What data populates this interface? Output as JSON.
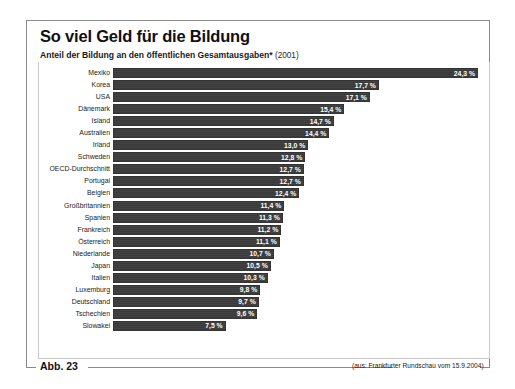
{
  "figure": {
    "title": "So viel Geld für die Bildung",
    "subtitle_main": "Anteil der Bildung an den öffentlichen Gesamtausgaben*",
    "subtitle_year": "(2001)",
    "figure_label": "Abb. 23",
    "source": "(aus: Frankfurter Rundschau vom 15.9.2004)"
  },
  "colors": {
    "bar_fill": "#3a3a3a",
    "frame": "#8a8a8a",
    "panel_border": "#c9c9c9",
    "text": "#111111",
    "value_text": "#ffffff"
  },
  "chart_data": {
    "type": "bar",
    "orientation": "horizontal",
    "title": "So viel Geld für die Bildung",
    "subtitle": "Anteil der Bildung an den öffentlichen Gesamtausgaben* (2001)",
    "xlabel": "",
    "ylabel": "",
    "unit": "%",
    "decimal_separator": ",",
    "xlim": [
      0,
      24.3
    ],
    "grid": false,
    "legend": false,
    "categories": [
      "Mexiko",
      "Korea",
      "USA",
      "Dänemark",
      "Island",
      "Australien",
      "Irland",
      "Schweden",
      "OECD-Durchschnitt",
      "Portugal",
      "Belgien",
      "Großbritannien",
      "Spanien",
      "Frankreich",
      "Österreich",
      "Niederlande",
      "Japan",
      "Italien",
      "Luxemburg",
      "Deutschland",
      "Tschechien",
      "Slowakei"
    ],
    "values": [
      24.3,
      17.7,
      17.1,
      15.4,
      14.7,
      14.4,
      13.0,
      12.8,
      12.7,
      12.7,
      12.4,
      11.4,
      11.3,
      11.2,
      11.1,
      10.7,
      10.5,
      10.3,
      9.8,
      9.7,
      9.6,
      7.5
    ],
    "value_labels": [
      "24,3 %",
      "17,7 %",
      "17,1 %",
      "15,4 %",
      "14,7 %",
      "14,4 %",
      "13,0 %",
      "12,8 %",
      "12,7 %",
      "12,7 %",
      "12,4 %",
      "11,4 %",
      "11,3 %",
      "11,2 %",
      "11,1 %",
      "10,7 %",
      "10,5 %",
      "10,3 %",
      "9,8 %",
      "9,7 %",
      "9,6 %",
      "7,5 %"
    ]
  }
}
